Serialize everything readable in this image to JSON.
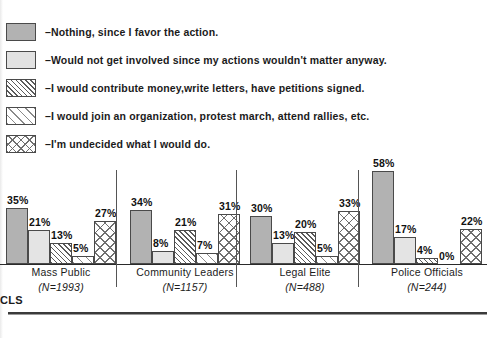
{
  "chart_data": {
    "type": "bar",
    "title": "",
    "subtitle": "",
    "xlabel": "",
    "ylabel": "",
    "ylim": [
      0,
      60
    ],
    "grid": false,
    "legend_position": "top-left",
    "categories": [
      "Mass Public",
      "Community Leaders",
      "Legal Elite",
      "Police Officials"
    ],
    "category_n": [
      "(N=1993)",
      "(N=1157)",
      "(N=488)",
      "(N=244)"
    ],
    "series": [
      {
        "name": "Nothing, since I favor the action.",
        "pattern": "solid-gray",
        "values": [
          35,
          34,
          30,
          58
        ],
        "labels": [
          "35%",
          "34%",
          "30%",
          "58%"
        ]
      },
      {
        "name": "Would not get involved since my actions wouldn't matter anyway.",
        "pattern": "light-gray",
        "values": [
          21,
          8,
          13,
          17
        ],
        "labels": [
          "21%",
          "8%",
          "13%",
          "17%"
        ]
      },
      {
        "name": "I would contribute money,write letters, have petitions signed.",
        "pattern": "dense-diagonal-hatch",
        "values": [
          13,
          21,
          20,
          4
        ],
        "labels": [
          "13%",
          "21%",
          "20%",
          "4%"
        ]
      },
      {
        "name": "I would join an organization, protest march, attend rallies, etc.",
        "pattern": "sparse-diagonal-hatch",
        "values": [
          5,
          7,
          5,
          0
        ],
        "labels": [
          "5%",
          "7%",
          "5%",
          "0%"
        ]
      },
      {
        "name": "I'm undecided what I would do.",
        "pattern": "cross-hatch",
        "values": [
          27,
          31,
          33,
          22
        ],
        "labels": [
          "27%",
          "31%",
          "33%",
          "22%"
        ]
      }
    ]
  },
  "legend": {
    "items": [
      {
        "dash": "–",
        "label": "Nothing, since I favor the action.",
        "swatch": "solid-gray"
      },
      {
        "dash": "–",
        "label": "Would not get involved since my actions wouldn't matter anyway.",
        "swatch": "light-gray"
      },
      {
        "dash": "–",
        "label": "I would contribute money,write letters, have petitions signed.",
        "swatch": "dense-diagonal-hatch"
      },
      {
        "dash": "–",
        "label": "I would join an organization, protest march, attend rallies, etc.",
        "swatch": "sparse-diagonal-hatch"
      },
      {
        "dash": "–",
        "label": "I'm undecided what I would do.",
        "swatch": "cross-hatch"
      }
    ]
  },
  "footer": {
    "code": "CLS",
    "caption": ""
  },
  "colors": {
    "solid_gray": "#b2b2b2",
    "light_gray": "#e4e4e4",
    "hatch_stroke": "#5a5a5a",
    "outline": "#4a4a4a",
    "text": "#111111"
  }
}
